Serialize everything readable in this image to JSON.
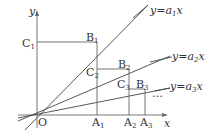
{
  "diagram": {
    "type": "coordinate-geometry",
    "axes": {
      "x_label": "x",
      "y_label": "y",
      "origin_label": "O"
    },
    "lines": [
      {
        "name": "y=a1x",
        "label_base": "y=a",
        "label_sub": "1",
        "label_tail": "x"
      },
      {
        "name": "y=a2x",
        "label_base": "y=a",
        "label_sub": "2",
        "label_tail": "x"
      },
      {
        "name": "y=a3x",
        "label_base": "y=a",
        "label_sub": "3",
        "label_tail": "x"
      }
    ],
    "points": {
      "A1": {
        "base": "A",
        "sub": "1"
      },
      "A2": {
        "base": "A",
        "sub": "2"
      },
      "A3": {
        "base": "A",
        "sub": "3"
      },
      "B1": {
        "base": "B",
        "sub": "1"
      },
      "B2": {
        "base": "B",
        "sub": "2"
      },
      "B3": {
        "base": "B",
        "sub": "3"
      },
      "C1": {
        "base": "C",
        "sub": "1"
      },
      "C2": {
        "base": "C",
        "sub": "2"
      },
      "C3": {
        "base": "C",
        "sub": "3"
      }
    },
    "ellipsis": "…",
    "colors": {
      "line": "#444444",
      "axis": "#666666",
      "text": "#333333",
      "background": "#ffffff"
    }
  }
}
